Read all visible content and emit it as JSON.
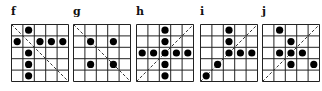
{
  "figure": {
    "grid_size": 5,
    "panels": [
      {
        "label": "f",
        "x": 11,
        "diagonal": "main",
        "dots": [
          [
            0,
            1
          ],
          [
            1,
            0
          ],
          [
            1,
            2
          ],
          [
            1,
            3
          ],
          [
            1,
            4
          ],
          [
            2,
            1
          ],
          [
            3,
            1
          ],
          [
            4,
            1
          ]
        ]
      },
      {
        "label": "g",
        "x": 73,
        "diagonal": "main",
        "dots": [
          [
            1,
            1
          ],
          [
            1,
            3
          ],
          [
            3,
            1
          ],
          [
            3,
            3
          ]
        ]
      },
      {
        "label": "h",
        "x": 136,
        "diagonal": "anti",
        "dots": [
          [
            0,
            2
          ],
          [
            1,
            2
          ],
          [
            2,
            0
          ],
          [
            2,
            1
          ],
          [
            2,
            2
          ],
          [
            2,
            3
          ],
          [
            2,
            4
          ],
          [
            3,
            2
          ],
          [
            4,
            2
          ]
        ]
      },
      {
        "label": "i",
        "x": 200,
        "diagonal": "anti",
        "dots": [
          [
            0,
            2
          ],
          [
            1,
            2
          ],
          [
            2,
            2
          ],
          [
            2,
            3
          ],
          [
            2,
            4
          ],
          [
            3,
            1
          ],
          [
            4,
            0
          ]
        ]
      },
      {
        "label": "j",
        "x": 262,
        "diagonal": "anti",
        "dots": [
          [
            0,
            1
          ],
          [
            1,
            2
          ],
          [
            2,
            1
          ],
          [
            2,
            2
          ],
          [
            2,
            3
          ],
          [
            3,
            2
          ],
          [
            3,
            4
          ]
        ]
      }
    ],
    "colors": {
      "line": "#222222",
      "dot": "#000000",
      "diagonal": "#333333"
    }
  }
}
